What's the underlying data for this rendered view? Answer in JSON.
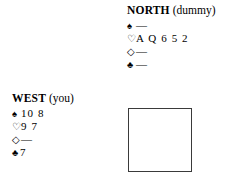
{
  "diagram": {
    "type": "bridge-hand-diagram",
    "background_color": "#ffffff",
    "text_color": "#000000",
    "box_border_color": "#3a3a3a"
  },
  "north": {
    "seat": "NORTH",
    "role": "(dummy)",
    "suits": [
      {
        "symbol": "♠",
        "name": "spade-symbol",
        "style": "solid",
        "cards": "—",
        "void": true
      },
      {
        "symbol": "♡",
        "name": "heart-symbol",
        "style": "hollow",
        "cards": "A Q 6 5 2",
        "void": false
      },
      {
        "symbol": "◇",
        "name": "diamond-symbol",
        "style": "hollow",
        "cards": "—",
        "void": true
      },
      {
        "symbol": "♣",
        "name": "club-symbol",
        "style": "solid",
        "cards": "—",
        "void": true
      }
    ]
  },
  "west": {
    "seat": "WEST",
    "role": "(you)",
    "suits": [
      {
        "symbol": "♠",
        "name": "spade-symbol",
        "style": "solid",
        "cards": "10 8",
        "void": false
      },
      {
        "symbol": "♡",
        "name": "heart-symbol",
        "style": "hollow",
        "cards": "9 7",
        "void": false
      },
      {
        "symbol": "◇",
        "name": "diamond-symbol",
        "style": "hollow",
        "cards": "—",
        "void": true
      },
      {
        "symbol": "♣",
        "name": "club-symbol",
        "style": "solid",
        "cards": "7",
        "void": false,
        "tight": true
      }
    ]
  },
  "south_box": {
    "label": "",
    "empty": true
  }
}
